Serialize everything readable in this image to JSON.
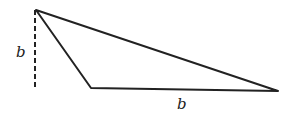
{
  "diagram": {
    "type": "triangle",
    "vertices": {
      "apex": [
        36,
        10
      ],
      "bottom_left": [
        91,
        88
      ],
      "bottom_right": [
        278,
        91
      ]
    },
    "height_line": {
      "from": [
        35,
        10
      ],
      "to": [
        35,
        89
      ],
      "style": "dashed"
    },
    "labels": {
      "height": "b",
      "base": "b"
    },
    "stroke_color": "#222222"
  }
}
